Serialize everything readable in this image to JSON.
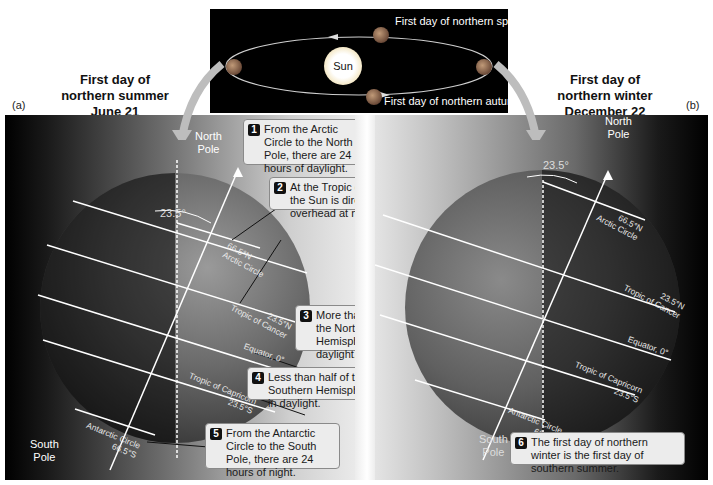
{
  "orbit_panel": {
    "sun_label": "Sun",
    "spring_label": "First day of northern spring",
    "autumn_label": "First day of northern autumn"
  },
  "panel_a": {
    "tag": "(a)",
    "heading_line1": "First day of",
    "heading_line2": "northern summer",
    "heading_line3": "June 21",
    "north_pole_line1": "North",
    "north_pole_line2": "Pole",
    "south_pole_line1": "South",
    "south_pole_line2": "Pole",
    "tilt_label": "23.5°",
    "latitudes": {
      "arctic": "66.5°N",
      "arctic_name": "Arctic Circle",
      "cancer": "23.5°N",
      "cancer_name": "Tropic of Cancer",
      "equator": "Equator, 0°",
      "capricorn_name": "Tropic of Capricorn",
      "capricorn": "23.5°S",
      "antarctic_name": "Antarctic Circle",
      "antarctic": "66.5°S"
    },
    "callouts": [
      {
        "num": "1",
        "text": "From the Arctic Circle to the North Pole, there are 24 hours of daylight."
      },
      {
        "num": "2",
        "text": "At the Tropic of Cancer, the Sun is directly overhead at noon."
      },
      {
        "num": "3",
        "text": "More than half of the Northern Hemisphere is in daylight."
      },
      {
        "num": "4",
        "text": "Less than half of the Southern Hemisphere is in daylight."
      },
      {
        "num": "5",
        "text": "From the Antarctic Circle to the South Pole, there are 24 hours of night."
      }
    ]
  },
  "panel_b": {
    "tag": "(b)",
    "heading_line1": "First day of",
    "heading_line2": "northern winter",
    "heading_line3": "December 22",
    "north_pole_line1": "North",
    "north_pole_line2": "Pole",
    "south_pole_line1": "South",
    "south_pole_line2": "Pole",
    "tilt_label": "23.5°",
    "latitudes": {
      "arctic": "66.5°N",
      "arctic_name": "Arctic Circle",
      "cancer": "23.5°N",
      "cancer_name": "Tropic of Cancer",
      "equator": "Equator, 0°",
      "capricorn_name": "Tropic of Capricorn",
      "capricorn": "23.5°S",
      "antarctic_name": "Antarctic Circle",
      "antarctic": "66.5°S"
    },
    "callouts": [
      {
        "num": "6",
        "text": "The first day of northern winter is the first day of southern summer."
      }
    ]
  },
  "colors": {
    "callout_bg": "#ececec",
    "number_badge": "#111111",
    "night": "#000000",
    "arrow": "#b8b8b8"
  }
}
